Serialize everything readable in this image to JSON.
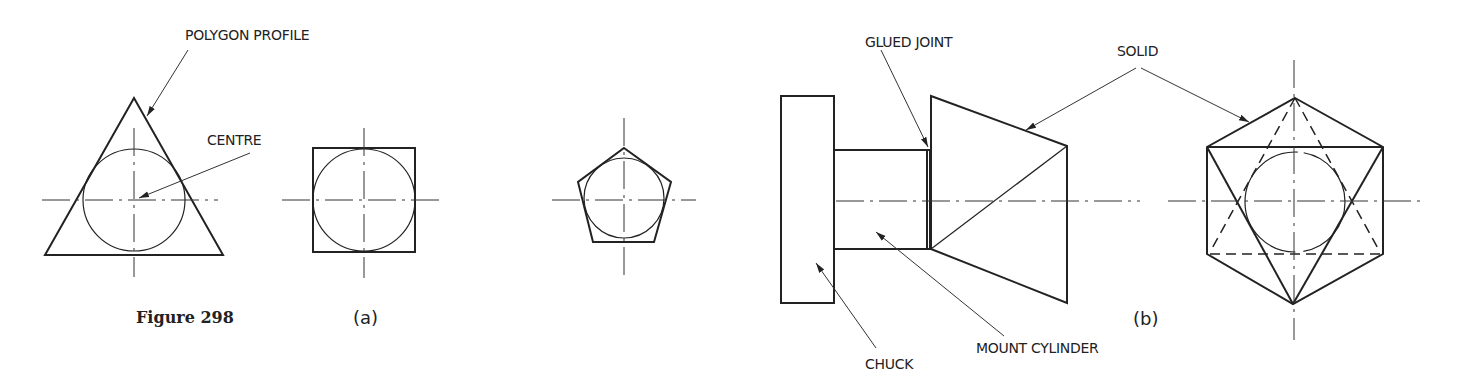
{
  "figure": {
    "title": "Figure 298",
    "panels": [
      {
        "id": "a",
        "label": "(a)",
        "shapes": [
          "triangle-with-inscribed-circle",
          "square-with-inscribed-circle",
          "pentagon-with-inscribed-circle"
        ],
        "callouts": [
          "POLYGON PROFILE",
          "CENTRE"
        ]
      },
      {
        "id": "b",
        "label": "(b)",
        "shapes": [
          "chuck",
          "mount-cylinder",
          "cone-solid",
          "hexagon-end-view"
        ],
        "callouts": [
          "GLUED JOINT",
          "SOLID",
          "CHUCK",
          "MOUNT CYLINDER"
        ]
      }
    ]
  },
  "labels": {
    "polygon_profile": "POLYGON PROFILE",
    "centre": "CENTRE",
    "figure_caption": "Figure 298",
    "panel_a": "(a)",
    "glued_joint": "GLUED JOINT",
    "solid": "SOLID",
    "chuck": "CHUCK",
    "mount_cylinder": "MOUNT CYLINDER",
    "panel_b": "(b)"
  },
  "colors": {
    "line": "#222222",
    "background": "#ffffff"
  }
}
